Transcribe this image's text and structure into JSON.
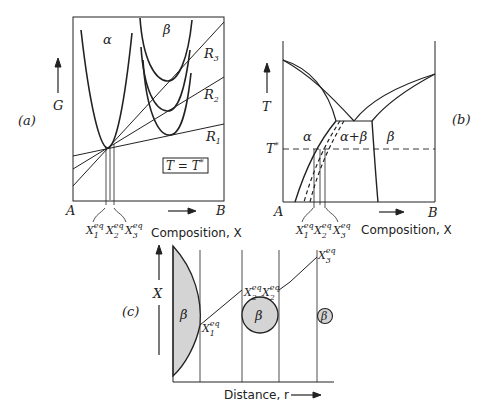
{
  "panel_a": {
    "label": "(a)",
    "y_axis": "G",
    "phase_alpha": "α",
    "phase_beta": "β",
    "lines": [
      "R3",
      "R2",
      "R1"
    ],
    "box": "T = T*",
    "x_left": "A",
    "x_right": "B",
    "x_label": "Composition, X",
    "x_marks": [
      "X1eq",
      "X2eq",
      "X3eq"
    ]
  },
  "panel_b": {
    "label": "(b)",
    "y_axis": "T",
    "t_star": "T*",
    "region_alpha": "α",
    "region_ab": "α+β",
    "region_beta": "β",
    "x_left": "A",
    "x_right": "B",
    "x_label": "Composition, X"
  },
  "panel_c": {
    "label": "(c)",
    "y_axis": "X",
    "x_label": "Distance, r",
    "beta": "β",
    "marks": [
      "X1eq",
      "X2eq",
      "X2eq",
      "X3eq"
    ]
  }
}
